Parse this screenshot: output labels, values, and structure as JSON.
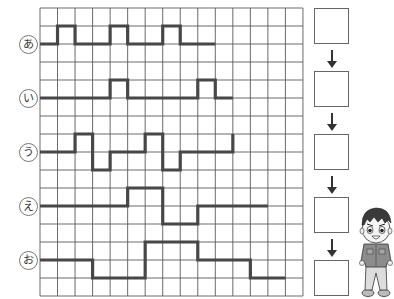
{
  "grid": {
    "left": 40,
    "top": 8,
    "cols": 15,
    "rows": 16,
    "cell_w": 17.53,
    "cell_h": 18,
    "line_color": "#5a5a5a",
    "wave_color": "#474747"
  },
  "rows": [
    {
      "label": "あ",
      "label_y": 44,
      "levels": {
        "high": 1,
        "mid": 2
      },
      "segments": [
        {
          "from": 0,
          "to": 1,
          "level": "mid"
        },
        {
          "from": 1,
          "to": 2,
          "level": "high"
        },
        {
          "from": 2,
          "to": 4,
          "level": "mid"
        },
        {
          "from": 4,
          "to": 5,
          "level": "high"
        },
        {
          "from": 5,
          "to": 7,
          "level": "mid"
        },
        {
          "from": 7,
          "to": 8,
          "level": "high"
        },
        {
          "from": 8,
          "to": 10,
          "level": "mid"
        }
      ]
    },
    {
      "label": "い",
      "label_y": 98,
      "levels": {
        "high": 4,
        "mid": 5
      },
      "segments": [
        {
          "from": 0,
          "to": 4,
          "level": "mid"
        },
        {
          "from": 4,
          "to": 5,
          "level": "high"
        },
        {
          "from": 5,
          "to": 9,
          "level": "mid"
        },
        {
          "from": 9,
          "to": 10,
          "level": "high"
        },
        {
          "from": 10,
          "to": 11,
          "level": "mid"
        }
      ]
    },
    {
      "label": "う",
      "label_y": 152,
      "levels": {
        "high": 7,
        "mid": 8,
        "low": 9
      },
      "segments": [
        {
          "from": 0,
          "to": 2,
          "level": "mid"
        },
        {
          "from": 2,
          "to": 3,
          "level": "high"
        },
        {
          "from": 3,
          "to": 4,
          "level": "low"
        },
        {
          "from": 4,
          "to": 6,
          "level": "mid"
        },
        {
          "from": 6,
          "to": 7,
          "level": "high"
        },
        {
          "from": 7,
          "to": 8,
          "level": "low"
        },
        {
          "from": 8,
          "to": 11,
          "level": "mid"
        },
        {
          "from": 11,
          "to": 11,
          "level": "high"
        }
      ]
    },
    {
      "label": "え",
      "label_y": 206,
      "levels": {
        "high": 10,
        "mid": 11,
        "low": 12
      },
      "segments": [
        {
          "from": 0,
          "to": 5,
          "level": "mid"
        },
        {
          "from": 5,
          "to": 7,
          "level": "high"
        },
        {
          "from": 7,
          "to": 9,
          "level": "low"
        },
        {
          "from": 9,
          "to": 13,
          "level": "mid"
        }
      ]
    },
    {
      "label": "お",
      "label_y": 260,
      "levels": {
        "high": 13,
        "mid": 14,
        "low": 15
      },
      "segments": [
        {
          "from": 0,
          "to": 3,
          "level": "mid"
        },
        {
          "from": 3,
          "to": 6,
          "level": "low"
        },
        {
          "from": 6,
          "to": 9,
          "level": "high"
        },
        {
          "from": 9,
          "to": 12,
          "level": "mid"
        },
        {
          "from": 12,
          "to": 14,
          "level": "low"
        }
      ]
    }
  ],
  "answer_boxes": [
    {
      "top": 8,
      "value": ""
    },
    {
      "top": 71,
      "value": ""
    },
    {
      "top": 134,
      "value": ""
    },
    {
      "top": 197,
      "value": ""
    },
    {
      "top": 260,
      "value": ""
    }
  ],
  "arrows": [
    {
      "top": 50,
      "height": 18
    },
    {
      "top": 113,
      "height": 18
    },
    {
      "top": 176,
      "height": 18
    },
    {
      "top": 239,
      "height": 18
    }
  ],
  "illustration": {
    "name": "boy-character",
    "hair": "#3a3a3a",
    "skin": "#f2f2f2",
    "shirt": "#8c8c8c",
    "pants": "#d8d8d8",
    "outline": "#333333"
  }
}
